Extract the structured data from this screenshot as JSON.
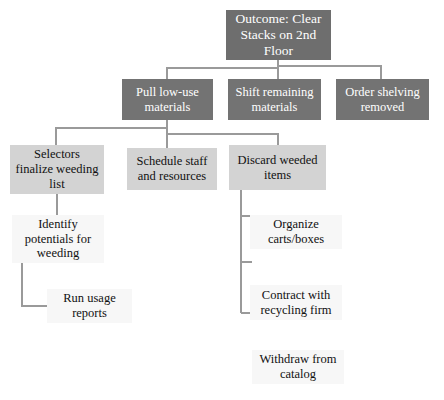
{
  "diagram": {
    "type": "tree-hierarchy",
    "title_node": "Outcome: Clear Stacks on 2nd Floor",
    "background_color": "#ffffff",
    "palette": {
      "level0_fill": "#6e6e6e",
      "level0_text": "#ffffff",
      "level1_fill": "#737373",
      "level1_text": "#ffffff",
      "level2_fill": "#d3d3d3",
      "level2_text": "#111111",
      "level3_fill": "#f7f7f7",
      "level3_text": "#111111",
      "connector_color": "#9a9a9a"
    },
    "nodes": [
      {
        "id": "outcome",
        "label": "Outcome: Clear\nStacks on 2nd\nFloor",
        "level": 0,
        "x": 226,
        "y": 10,
        "w": 105,
        "h": 50
      },
      {
        "id": "pull-low-use",
        "label": "Pull low-use\nmaterials",
        "level": 1,
        "x": 122,
        "y": 79,
        "w": 91,
        "h": 41
      },
      {
        "id": "shift-remaining",
        "label": "Shift remaining\nmaterials",
        "level": 1,
        "x": 228,
        "y": 79,
        "w": 93,
        "h": 41
      },
      {
        "id": "order-shelving",
        "label": "Order shelving\nremoved",
        "level": 1,
        "x": 336,
        "y": 79,
        "w": 93,
        "h": 41
      },
      {
        "id": "selectors-finalize",
        "label": "Selectors\nfinalize weeding\nlist",
        "level": 2,
        "x": 10,
        "y": 145,
        "w": 94,
        "h": 49
      },
      {
        "id": "schedule-staff",
        "label": "Schedule staff\nand resources",
        "level": 2,
        "x": 127,
        "y": 148,
        "w": 90,
        "h": 42
      },
      {
        "id": "discard-weeded",
        "label": "Discard weeded\nitems",
        "level": 2,
        "x": 229,
        "y": 145,
        "w": 97,
        "h": 45
      },
      {
        "id": "identify-potentials",
        "label": "Identify\npotentials for\nweeding",
        "level": 3,
        "x": 12,
        "y": 215,
        "w": 92,
        "h": 48
      },
      {
        "id": "run-usage-reports",
        "label": "Run usage\nreports",
        "level": 3,
        "x": 47,
        "y": 289,
        "w": 85,
        "h": 34
      },
      {
        "id": "organize-carts",
        "label": "Organize\ncarts/boxes",
        "level": 3,
        "x": 250,
        "y": 215,
        "w": 92,
        "h": 34
      },
      {
        "id": "contract-recycling",
        "label": "Contract with\nrecycling firm",
        "level": 3,
        "x": 250,
        "y": 285,
        "w": 92,
        "h": 35
      },
      {
        "id": "withdraw-catalog",
        "label": "Withdraw from\ncatalog",
        "level": 3,
        "x": 252,
        "y": 350,
        "w": 92,
        "h": 34
      }
    ],
    "edges": [
      {
        "from": "outcome",
        "to": "pull-low-use"
      },
      {
        "from": "outcome",
        "to": "shift-remaining"
      },
      {
        "from": "outcome",
        "to": "order-shelving"
      },
      {
        "from": "pull-low-use",
        "to": "selectors-finalize"
      },
      {
        "from": "pull-low-use",
        "to": "schedule-staff"
      },
      {
        "from": "pull-low-use",
        "to": "discard-weeded"
      },
      {
        "from": "selectors-finalize",
        "to": "identify-potentials"
      },
      {
        "from": "identify-potentials",
        "to": "run-usage-reports"
      },
      {
        "from": "discard-weeded",
        "to": "organize-carts"
      },
      {
        "from": "discard-weeded",
        "to": "contract-recycling"
      }
    ]
  }
}
